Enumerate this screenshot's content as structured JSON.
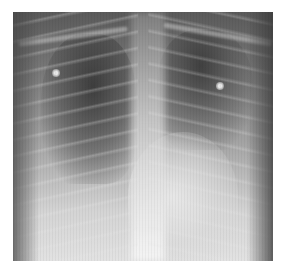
{
  "image": {
    "subject": "chest radiograph",
    "description": "Frontal chest X-ray with bilateral lung opacities, two round markers in upper lung fields",
    "colors": {
      "background": "#ffffff",
      "dark_lung": "#4a4a4a",
      "bright_bone": "#e8e8e8"
    }
  }
}
